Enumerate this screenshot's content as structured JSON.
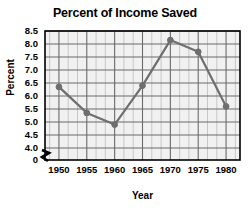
{
  "chart_data": {
    "type": "line",
    "title": "Percent of Income Saved",
    "xlabel": "Year",
    "ylabel": "Percent",
    "x": [
      1950,
      1955,
      1960,
      1965,
      1970,
      1975,
      1980
    ],
    "values": [
      6.35,
      5.35,
      4.9,
      6.4,
      8.15,
      7.7,
      5.6
    ],
    "xtick_labels": [
      "1950",
      "1955",
      "1960",
      "1965",
      "1970",
      "1975",
      "1980"
    ],
    "ytick_labels": [
      "8.5",
      "8.0",
      "7.5",
      "7.0",
      "6.5",
      "6.0",
      "5.5",
      "5.0",
      "4.5",
      "4.0",
      "0"
    ],
    "ytick_values": [
      8.5,
      8.0,
      7.5,
      7.0,
      6.5,
      6.0,
      5.5,
      5.0,
      4.5,
      4.0,
      0
    ],
    "ylim": [
      4.0,
      8.5
    ],
    "xlim": [
      1947.5,
      1982.5
    ],
    "grid": true,
    "minor_grid": true,
    "axis_break": true,
    "legend": "none",
    "line_color": "#6e6e6e",
    "marker_color": "#6e6e6e",
    "grid_color": "#6b6b6b",
    "minor_grid_color": "#bdbdbd",
    "plot_background": "#f1f1f1",
    "axis_color": "#000000"
  }
}
